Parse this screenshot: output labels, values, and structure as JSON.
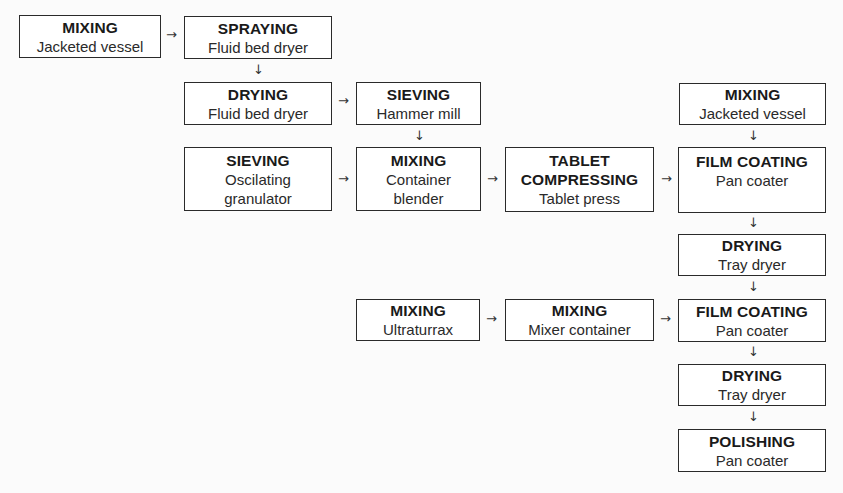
{
  "diagram": {
    "nodes": [
      {
        "id": "n1",
        "title": "MIXING",
        "sub": "Jacketed vessel",
        "x": 19,
        "y": 15,
        "w": 142,
        "h": 43
      },
      {
        "id": "n2",
        "title": "SPRAYING",
        "sub": "Fluid bed dryer",
        "x": 184,
        "y": 16,
        "w": 148,
        "h": 43
      },
      {
        "id": "n3",
        "title": "DRYING",
        "sub": "Fluid bed dryer",
        "x": 184,
        "y": 82,
        "w": 148,
        "h": 43
      },
      {
        "id": "n4",
        "title": "SIEVING",
        "sub": "Hammer mill",
        "x": 356,
        "y": 82,
        "w": 125,
        "h": 43
      },
      {
        "id": "n5",
        "title": "SIEVING",
        "sub": "Oscilating\ngranulator",
        "sub1": "Oscilating",
        "sub2": "granulator",
        "x": 184,
        "y": 147,
        "w": 148,
        "h": 64
      },
      {
        "id": "n6",
        "title": "MIXING",
        "sub1": "Container",
        "sub2": "blender",
        "x": 356,
        "y": 147,
        "w": 125,
        "h": 64
      },
      {
        "id": "n7",
        "title1": "TABLET",
        "title2": "COMPRESSING",
        "sub": "Tablet press",
        "x": 505,
        "y": 147,
        "w": 149,
        "h": 65
      },
      {
        "id": "n8",
        "title": "MIXING",
        "sub": "Jacketed vessel",
        "x": 679,
        "y": 83,
        "w": 147,
        "h": 42
      },
      {
        "id": "n9",
        "title": "FILM COATING",
        "sub": "Pan coater",
        "x": 678,
        "y": 147,
        "w": 148,
        "h": 66
      },
      {
        "id": "n10",
        "title": "DRYING",
        "sub": "Tray dryer",
        "x": 678,
        "y": 234,
        "w": 148,
        "h": 42
      },
      {
        "id": "n11",
        "title": "MIXING",
        "sub": "Ultraturrax",
        "x": 356,
        "y": 299,
        "w": 124,
        "h": 42
      },
      {
        "id": "n12",
        "title": "MIXING",
        "sub": "Mixer container",
        "x": 505,
        "y": 299,
        "w": 149,
        "h": 42
      },
      {
        "id": "n13",
        "title": "FILM COATING",
        "sub": "Pan coater",
        "x": 678,
        "y": 299,
        "w": 148,
        "h": 43
      },
      {
        "id": "n14",
        "title": "DRYING",
        "sub": "Tray dryer",
        "x": 678,
        "y": 364,
        "w": 148,
        "h": 42
      },
      {
        "id": "n15",
        "title": "POLISHING",
        "sub": "Pan coater",
        "x": 678,
        "y": 429,
        "w": 148,
        "h": 43
      }
    ],
    "edges": [
      {
        "from": "n1",
        "to": "n2",
        "glyph": "→"
      },
      {
        "from": "n2",
        "to": "n3",
        "glyph": "↓"
      },
      {
        "from": "n3",
        "to": "n4",
        "glyph": "→"
      },
      {
        "from": "n4",
        "to": "n6",
        "glyph": "↓"
      },
      {
        "from": "n5",
        "to": "n6",
        "glyph": "→"
      },
      {
        "from": "n6",
        "to": "n7",
        "glyph": "→"
      },
      {
        "from": "n7",
        "to": "n9",
        "glyph": "→"
      },
      {
        "from": "n8",
        "to": "n9",
        "glyph": "↓"
      },
      {
        "from": "n9",
        "to": "n10",
        "glyph": "↓"
      },
      {
        "from": "n10",
        "to": "n13",
        "glyph": "↓"
      },
      {
        "from": "n11",
        "to": "n12",
        "glyph": "→"
      },
      {
        "from": "n12",
        "to": "n13",
        "glyph": "→"
      },
      {
        "from": "n13",
        "to": "n14",
        "glyph": "↓"
      },
      {
        "from": "n14",
        "to": "n15",
        "glyph": "↓"
      }
    ]
  },
  "arrows": {
    "right": "→",
    "down": "↓"
  }
}
